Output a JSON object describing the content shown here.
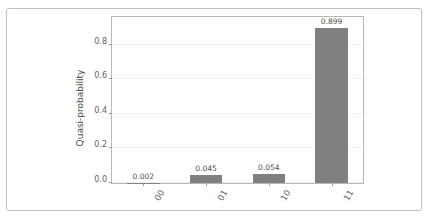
{
  "artifact": {
    "clipped_text": "·  ·"
  },
  "chart_data": {
    "type": "bar",
    "title": "",
    "subtitle": "",
    "xlabel": "",
    "ylabel": "Quasi-probability",
    "categories": [
      "00",
      "01",
      "10",
      "11"
    ],
    "values": [
      0.002,
      0.045,
      0.054,
      0.899
    ],
    "value_labels": [
      "0.002",
      "0.045",
      "0.054",
      "0.899"
    ],
    "ylim": [
      0.0,
      0.96
    ],
    "yticks": [
      0.0,
      0.2,
      0.4,
      0.6,
      0.8
    ],
    "ytick_labels": [
      "0.0",
      "0.2",
      "0.4",
      "0.6",
      "0.8"
    ],
    "grid": "horizontal",
    "legend": null,
    "bar_color": "#808080",
    "xtick_rotation": -60
  },
  "style": {
    "background": "#ffffff",
    "card_border": "#bfbfbf",
    "axes_border": "#b8b8b8",
    "grid_color": "#f0f0f0",
    "tick_text": "#5f5f5f",
    "label_text": "#4a4a4a",
    "value_text": "#4d4d4d"
  }
}
